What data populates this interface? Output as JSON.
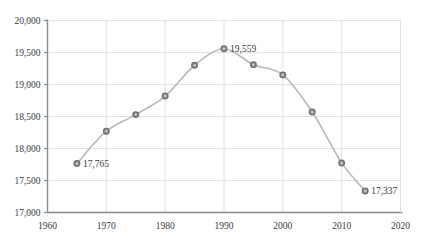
{
  "chart_data": {
    "type": "line",
    "title": "",
    "subtitle": "",
    "xlabel": "",
    "ylabel": "",
    "xlim": [
      1960,
      2020
    ],
    "ylim": [
      17000,
      20000
    ],
    "grid": true,
    "legend": "none",
    "x_ticks": [
      "1960",
      "1970",
      "1980",
      "1990",
      "2000",
      "2010",
      "2020"
    ],
    "x_tick_values": [
      1960,
      1970,
      1980,
      1990,
      2000,
      2010,
      2020
    ],
    "y_ticks": [
      "17,000",
      "17,500",
      "18,000",
      "18,500",
      "19,000",
      "19,500",
      "20,000"
    ],
    "y_tick_values": [
      17000,
      17500,
      18000,
      18500,
      19000,
      19500,
      20000
    ],
    "x": [
      1965,
      1970,
      1975,
      1980,
      1985,
      1990,
      1995,
      2000,
      2005,
      2010,
      2014
    ],
    "values": [
      17765,
      18270,
      18530,
      18820,
      19300,
      19559,
      19310,
      19150,
      18570,
      17775,
      17337
    ],
    "series": [
      {
        "name": "",
        "values": [
          17765,
          18270,
          18530,
          18820,
          19300,
          19559,
          19310,
          19150,
          18570,
          17775,
          17337
        ]
      }
    ],
    "annotations": [
      {
        "text": "17,765",
        "x": 1965,
        "y": 17765,
        "anchor": "right"
      },
      {
        "text": "19,559",
        "x": 1990,
        "y": 19559,
        "anchor": "right"
      },
      {
        "text": "17,337",
        "x": 2014,
        "y": 17337,
        "anchor": "right"
      }
    ],
    "colors": {
      "line": "#b9b9b9",
      "marker_fill": "#9a9a9a",
      "marker_edge": "#6e6e6e",
      "grid": "#e2e2e2",
      "axis": "#8c8c8c",
      "text": "#3c3c3c",
      "background": "#ffffff"
    },
    "marker": "circle",
    "marker_size": 4
  }
}
